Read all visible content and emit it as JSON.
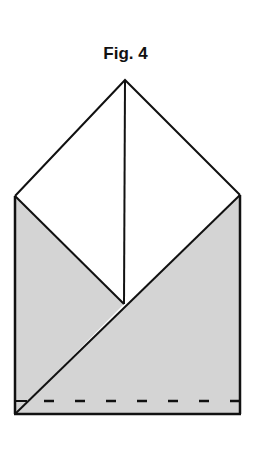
{
  "figure": {
    "title": "Fig. 4",
    "colors": {
      "stroke": "#111111",
      "shade": "#d4d4d4",
      "background": "#ffffff"
    },
    "elements": {
      "apex": [
        125,
        80
      ],
      "left_corner": [
        15,
        196
      ],
      "right_corner": [
        240,
        195
      ],
      "center_point": [
        124,
        304
      ],
      "bottom_left": [
        15,
        414
      ],
      "bottom_right": [
        240,
        414
      ],
      "dashed_line_y": 401
    }
  }
}
